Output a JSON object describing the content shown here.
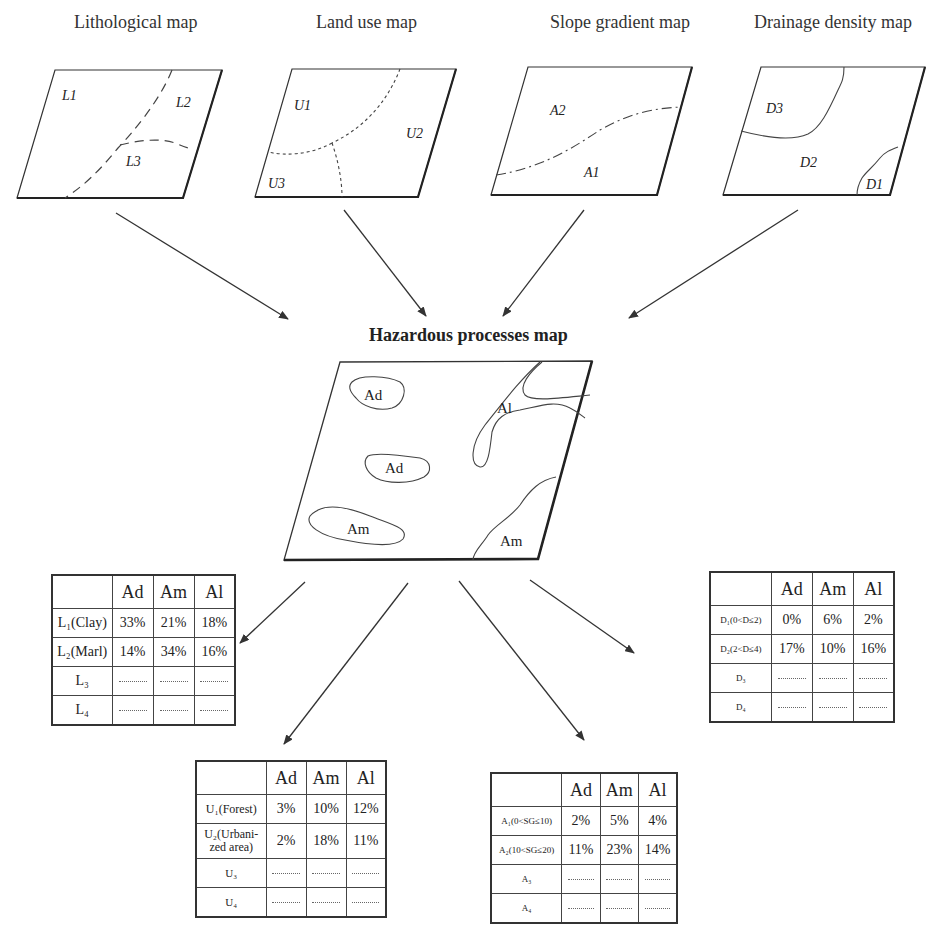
{
  "top_cutoff_text": "approach methodology",
  "input_maps": [
    {
      "title": "Lithological map",
      "labels": [
        "L1",
        "L2",
        "L3"
      ]
    },
    {
      "title": "Land use map",
      "labels": [
        "U1",
        "U2",
        "U3"
      ]
    },
    {
      "title": "Slope gradient map",
      "labels": [
        "A2",
        "A1"
      ]
    },
    {
      "title": "Drainage density map",
      "labels": [
        "D3",
        "D2",
        "D1"
      ]
    }
  ],
  "hazard_map": {
    "title": "Hazardous processes map",
    "labels": [
      "Ad",
      "Ad",
      "Am",
      "Al",
      "Am"
    ]
  },
  "tables": {
    "lithology": {
      "columns": [
        "",
        "Ad",
        "Am",
        "Al"
      ],
      "rows": [
        {
          "label": "L₁(Clay)",
          "values": [
            "33%",
            "21%",
            "18%"
          ]
        },
        {
          "label": "L₂(Marl)",
          "values": [
            "14%",
            "34%",
            "16%"
          ]
        },
        {
          "label": "L₃",
          "values": [
            "……",
            "……",
            "……"
          ]
        },
        {
          "label": "L₄",
          "values": [
            "……",
            "……",
            "……"
          ]
        }
      ]
    },
    "land_use": {
      "columns": [
        "",
        "Ad",
        "Am",
        "Al"
      ],
      "rows": [
        {
          "label": "U₁(Forest)",
          "values": [
            "3%",
            "10%",
            "12%"
          ]
        },
        {
          "label": "U₂(Urbani-zed area)",
          "values": [
            "2%",
            "18%",
            "11%"
          ]
        },
        {
          "label": "U₃",
          "values": [
            "……",
            "……",
            "……"
          ]
        },
        {
          "label": "U₄",
          "values": [
            "……",
            "……",
            "……"
          ]
        }
      ]
    },
    "slope": {
      "columns": [
        "",
        "Ad",
        "Am",
        "Al"
      ],
      "rows": [
        {
          "label": "A₁(0<SG≤10)",
          "values": [
            "2%",
            "5%",
            "4%"
          ]
        },
        {
          "label": "A₂(10<SG≤20)",
          "values": [
            "11%",
            "23%",
            "14%"
          ]
        },
        {
          "label": "A₃",
          "values": [
            "……",
            "……",
            "……"
          ]
        },
        {
          "label": "A₄",
          "values": [
            "……",
            "……",
            "……"
          ]
        }
      ]
    },
    "drainage": {
      "columns": [
        "",
        "Ad",
        "Am",
        "Al"
      ],
      "rows": [
        {
          "label": "D₁(0<D≤2)",
          "values": [
            "0%",
            "6%",
            "2%"
          ]
        },
        {
          "label": "D₂(2<D≤4)",
          "values": [
            "17%",
            "10%",
            "16%"
          ]
        },
        {
          "label": "D₃",
          "values": [
            "……",
            "……",
            "……"
          ]
        },
        {
          "label": "D₄",
          "values": [
            "……",
            "……",
            "……"
          ]
        }
      ]
    }
  }
}
